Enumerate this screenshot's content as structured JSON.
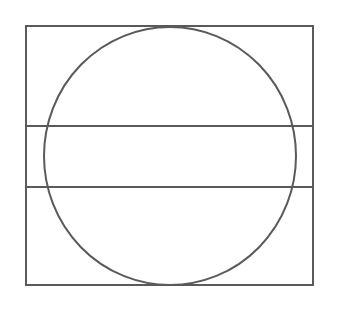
{
  "diagram": {
    "canvas": {
      "width": 342,
      "height": 309,
      "background": "#ffffff"
    },
    "stroke_color": "#5a5a5a",
    "stroke_width": 2,
    "rectangle": {
      "x": 26,
      "y": 26,
      "width": 287,
      "height": 259
    },
    "horizontal_lines": [
      {
        "y": 126,
        "x1": 26,
        "x2": 313
      },
      {
        "y": 187,
        "x1": 26,
        "x2": 313
      }
    ],
    "circle": {
      "cx": 170,
      "cy": 156,
      "rx": 126,
      "ry": 129
    }
  }
}
